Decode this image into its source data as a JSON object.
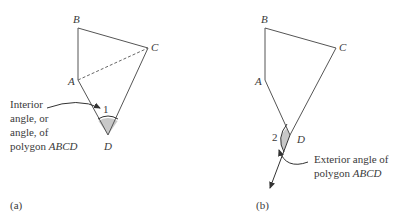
{
  "figure_a": {
    "vertices": {
      "A": "A",
      "B": "B",
      "C": "C",
      "D": "D"
    },
    "angle_number": "1",
    "annotation_lines": [
      "Interior",
      "angle, or",
      "angle, of"
    ],
    "annotation_last_prefix": "polygon ",
    "annotation_last_italic": "ABCD",
    "caption": "(a)",
    "diagonal": "AC (dashed)"
  },
  "figure_b": {
    "vertices": {
      "A": "A",
      "B": "B",
      "C": "C",
      "D": "D"
    },
    "angle_number": "2",
    "annotation_line1": "Exterior angle of",
    "annotation_last_prefix": "polygon ",
    "annotation_last_italic": "ABCD",
    "caption": "(b)"
  },
  "colors": {
    "line": "#555555",
    "fill": "#c8c8c8",
    "text": "#3a3a3a"
  }
}
